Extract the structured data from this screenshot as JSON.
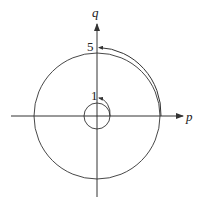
{
  "diagram": {
    "axes": {
      "x_label": "p",
      "y_label": "q"
    },
    "circles": [
      {
        "name": "small-circle",
        "radius_units": 1,
        "label": "1"
      },
      {
        "name": "large-circle",
        "radius_units": 5,
        "label": "5"
      }
    ],
    "trajectories": [
      {
        "name": "small-spiral-arc",
        "from": "p-axis near small circle",
        "to": "q = 1"
      },
      {
        "name": "large-spiral-arc",
        "from": "p-axis near large circle",
        "to": "q = 5"
      }
    ],
    "colors": {
      "line": "#333333",
      "background": "#ffffff"
    }
  }
}
